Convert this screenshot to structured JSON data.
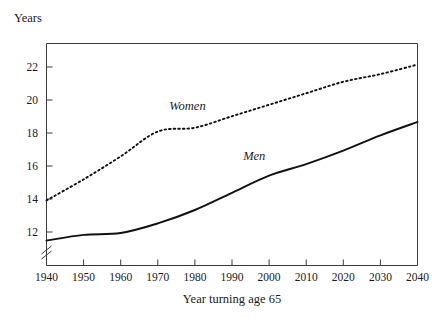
{
  "chart_data": {
    "type": "line",
    "title": "",
    "ylabel": "Years",
    "xlabel": "Year turning age 65",
    "xlim": [
      1940,
      2040
    ],
    "ylim": [
      11.4,
      23.0
    ],
    "grid": false,
    "legend_position": "inline-annotation",
    "y_axis_break": true,
    "y_axis_break_symbol": "//",
    "x_ticks": [
      1940,
      1950,
      1960,
      1970,
      1980,
      1990,
      2000,
      2010,
      2020,
      2030,
      2040
    ],
    "x_tick_labels": [
      "1940",
      "1950",
      "1960",
      "1970",
      "1980",
      "1990",
      "2000",
      "2010",
      "2020",
      "2030",
      "2040"
    ],
    "y_ticks": [
      12,
      14,
      16,
      18,
      20,
      22
    ],
    "y_tick_labels": [
      "12",
      "14",
      "16",
      "18",
      "20",
      "22"
    ],
    "x": [
      1940,
      1950,
      1960,
      1970,
      1980,
      1990,
      2000,
      2010,
      2020,
      2030,
      2040
    ],
    "series": [
      {
        "name": "Women",
        "style": "dotted",
        "color": "#111111",
        "values": [
          14.8,
          15.9,
          17.1,
          18.4,
          18.6,
          19.2,
          19.8,
          20.4,
          21.0,
          21.4,
          21.9
        ],
        "label": "Women",
        "label_x": 1978,
        "label_y": 19.5
      },
      {
        "name": "Men",
        "style": "solid",
        "color": "#111111",
        "values": [
          12.7,
          13.0,
          13.1,
          13.6,
          14.3,
          15.2,
          16.1,
          16.7,
          17.4,
          18.2,
          18.9
        ],
        "label": "Men",
        "label_x": 1996,
        "label_y": 16.9
      }
    ],
    "annotations": [
      {
        "text": "Women",
        "series": "Women"
      },
      {
        "text": "Men",
        "series": "Men"
      }
    ]
  },
  "axis": {
    "y_title": "Years",
    "x_title": "Year turning age 65"
  },
  "colors": {
    "background": "#ffffff",
    "axis": "#3b3b3b",
    "ink": "#111111",
    "text": "#1a1a1a"
  }
}
